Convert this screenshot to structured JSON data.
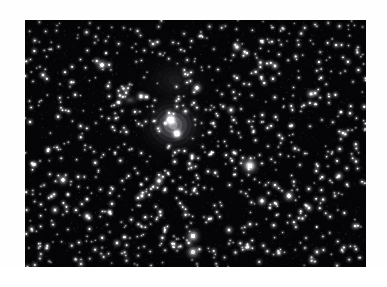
{
  "page": {
    "background_color": "#ffffff",
    "width": 387,
    "height": 287
  },
  "photo": {
    "name": "astronomical-sky-field",
    "x": 25,
    "y": 20,
    "width": 341,
    "height": 247,
    "background_color": "#050507",
    "palette": {
      "sky_dark": "#050507",
      "sky_mid": "#0e0e12",
      "star_white": "#ffffff",
      "star_dim": "#9a9aa2",
      "nebula_glow": "#e8e8ea"
    },
    "description": "Monochrome wide-field astrophotograph: dense star field with a bright diffuse reflection nebula at center, a smaller cometary nebula upper-left, and a vertical pair of bright stars at bottom center."
  },
  "chart_data": {
    "type": "scatter",
    "title": "",
    "xlabel": "",
    "ylabel": "",
    "xlim": [
      0,
      341
    ],
    "ylim": [
      0,
      247
    ],
    "grid": false,
    "legend": null,
    "nebulae": [
      {
        "name": "central-bright-nebula",
        "cx": 148,
        "cy": 105,
        "rx": 42,
        "ry": 38,
        "peak": 0.78
      },
      {
        "name": "central-nebula-core-upper",
        "cx": 145,
        "cy": 99,
        "rx": 9,
        "ry": 8,
        "peak": 1.0
      },
      {
        "name": "central-nebula-core-lower",
        "cx": 152,
        "cy": 113,
        "rx": 8,
        "ry": 7,
        "peak": 0.95
      },
      {
        "name": "cometary-nebula-upper-left",
        "cx": 105,
        "cy": 80,
        "rx": 15,
        "ry": 9,
        "peak": 0.42
      },
      {
        "name": "faint-halo-upper",
        "cx": 150,
        "cy": 60,
        "rx": 55,
        "ry": 40,
        "peak": 0.12
      },
      {
        "name": "bright-star-halo-right",
        "cx": 224,
        "cy": 145,
        "rx": 16,
        "ry": 15,
        "peak": 0.5
      }
    ],
    "bright_stars": [
      {
        "x": 225,
        "y": 146,
        "mag": 1.0,
        "r": 3.6
      },
      {
        "x": 168,
        "y": 216,
        "mag": 0.98,
        "r": 3.5
      },
      {
        "x": 168,
        "y": 232,
        "mag": 0.95,
        "r": 3.4
      },
      {
        "x": 146,
        "y": 100,
        "mag": 1.0,
        "r": 3.2
      },
      {
        "x": 152,
        "y": 114,
        "mag": 0.96,
        "r": 2.9
      },
      {
        "x": 77,
        "y": 45,
        "mag": 0.92,
        "r": 3.0
      },
      {
        "x": 116,
        "y": 76,
        "mag": 0.8,
        "r": 2.4
      },
      {
        "x": 172,
        "y": 68,
        "mag": 0.9,
        "r": 2.7
      },
      {
        "x": 206,
        "y": 90,
        "mag": 0.78,
        "r": 2.3
      },
      {
        "x": 134,
        "y": 161,
        "mag": 0.85,
        "r": 2.6
      },
      {
        "x": 117,
        "y": 176,
        "mag": 0.72,
        "r": 2.2
      },
      {
        "x": 38,
        "y": 160,
        "mag": 0.88,
        "r": 2.7
      },
      {
        "x": 30,
        "y": 190,
        "mag": 0.75,
        "r": 2.2
      },
      {
        "x": 62,
        "y": 196,
        "mag": 0.8,
        "r": 2.3
      },
      {
        "x": 92,
        "y": 223,
        "mag": 0.7,
        "r": 2.1
      },
      {
        "x": 204,
        "y": 210,
        "mag": 0.74,
        "r": 2.2
      },
      {
        "x": 237,
        "y": 181,
        "mag": 0.86,
        "r": 2.6
      },
      {
        "x": 264,
        "y": 176,
        "mag": 0.92,
        "r": 2.9
      },
      {
        "x": 250,
        "y": 165,
        "mag": 0.7,
        "r": 2.0
      },
      {
        "x": 284,
        "y": 188,
        "mag": 0.76,
        "r": 2.2
      },
      {
        "x": 292,
        "y": 232,
        "mag": 0.72,
        "r": 2.1
      },
      {
        "x": 314,
        "y": 156,
        "mag": 0.8,
        "r": 2.3
      },
      {
        "x": 286,
        "y": 74,
        "mag": 0.82,
        "r": 2.4
      },
      {
        "x": 250,
        "y": 46,
        "mag": 0.76,
        "r": 2.2
      },
      {
        "x": 212,
        "y": 27,
        "mag": 0.84,
        "r": 2.5
      },
      {
        "x": 128,
        "y": 24,
        "mag": 0.7,
        "r": 2.0
      },
      {
        "x": 18,
        "y": 55,
        "mag": 0.74,
        "r": 2.1
      },
      {
        "x": 318,
        "y": 113,
        "mag": 0.72,
        "r": 2.0
      },
      {
        "x": 330,
        "y": 206,
        "mag": 0.7,
        "r": 2.0
      },
      {
        "x": 56,
        "y": 244,
        "mag": 0.68,
        "r": 2.0
      }
    ],
    "field_star_count": 1900,
    "field_star_seed": 20240917
  }
}
